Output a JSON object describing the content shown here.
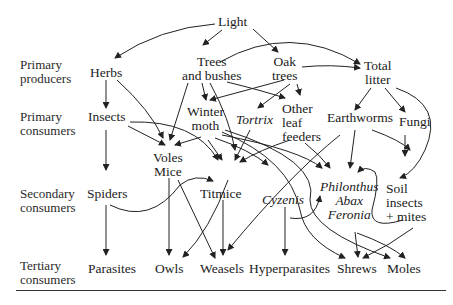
{
  "levels": [
    {
      "id": "primary-producers",
      "label": "Primary\nproducers"
    },
    {
      "id": "primary-consumers",
      "label": "Primary\nconsumers"
    },
    {
      "id": "secondary-consumers",
      "label": "Secondary\nconsumers"
    },
    {
      "id": "tertiary-consumers",
      "label": "Tertiary\nconsumers"
    }
  ],
  "nodes": {
    "light": "Light",
    "herbs": "Herbs",
    "trees_bushes": "Trees\nand bushes",
    "oak_trees": "Oak\ntrees",
    "total_litter": "Total\nlitter",
    "insects": "Insects",
    "winter_moth": "Winter\nmoth",
    "tortrix": "Tortrix",
    "other_leaf_feeders": "Other\nleaf\nfeeders",
    "earthworms": "Earthworms",
    "fungi": "Fungi",
    "voles_mice": "Voles\nMice",
    "spiders": "Spiders",
    "titmice": "Titmice",
    "cyzenis": "Cyzenis",
    "philonthus": "Philonthus\nAbax\nFeronia",
    "soil_insects": "Soil\ninsects\n+ mites",
    "parasites": "Parasites",
    "owls": "Owls",
    "weasels": "Weasels",
    "hyperparasites": "Hyperparasites",
    "shrews": "Shrews",
    "moles": "Moles"
  },
  "edges": [
    [
      "Light",
      "Herbs"
    ],
    [
      "Light",
      "Trees and bushes"
    ],
    [
      "Light",
      "Oak trees"
    ],
    [
      "Trees and bushes",
      "Total litter"
    ],
    [
      "Oak trees",
      "Total litter"
    ],
    [
      "Herbs",
      "Insects"
    ],
    [
      "Herbs",
      "Voles Mice"
    ],
    [
      "Trees and bushes",
      "Voles Mice"
    ],
    [
      "Trees and bushes",
      "Winter moth"
    ],
    [
      "Trees and bushes",
      "Titmice"
    ],
    [
      "Trees and bushes",
      "Other leaf feeders"
    ],
    [
      "Oak trees",
      "Winter moth"
    ],
    [
      "Oak trees",
      "Tortrix"
    ],
    [
      "Oak trees",
      "Other leaf feeders"
    ],
    [
      "Total litter",
      "Earthworms"
    ],
    [
      "Total litter",
      "Fungi"
    ],
    [
      "Total litter",
      "Soil insects + mites"
    ],
    [
      "Insects",
      "Spiders"
    ],
    [
      "Insects",
      "Voles Mice"
    ],
    [
      "Insects",
      "Titmice"
    ],
    [
      "Winter moth",
      "Voles Mice"
    ],
    [
      "Winter moth",
      "Titmice"
    ],
    [
      "Winter moth",
      "Cyzenis"
    ],
    [
      "Winter moth",
      "Philonthus Abax Feronia"
    ],
    [
      "Winter moth",
      "Shrews"
    ],
    [
      "Winter moth",
      "Moles"
    ],
    [
      "Tortrix",
      "Titmice"
    ],
    [
      "Other leaf feeders",
      "Titmice"
    ],
    [
      "Other leaf feeders",
      "Philonthus Abax Feronia"
    ],
    [
      "Earthworms",
      "Philonthus Abax Feronia"
    ],
    [
      "Earthworms",
      "Moles"
    ],
    [
      "Earthworms",
      "Weasels"
    ],
    [
      "Fungi",
      "Soil insects + mites"
    ],
    [
      "Spiders",
      "Titmice"
    ],
    [
      "Spiders",
      "Parasites"
    ],
    [
      "Voles Mice",
      "Owls"
    ],
    [
      "Voles Mice",
      "Weasels"
    ],
    [
      "Titmice",
      "Owls"
    ],
    [
      "Titmice",
      "Weasels"
    ],
    [
      "Cyzenis",
      "Hyperparasites"
    ],
    [
      "Cyzenis",
      "Philonthus Abax Feronia"
    ],
    [
      "Philonthus Abax Feronia",
      "Shrews"
    ],
    [
      "Philonthus Abax Feronia",
      "Moles"
    ],
    [
      "Soil insects + mites",
      "Shrews"
    ],
    [
      "Soil insects + mites",
      "Philonthus Abax Feronia"
    ]
  ]
}
